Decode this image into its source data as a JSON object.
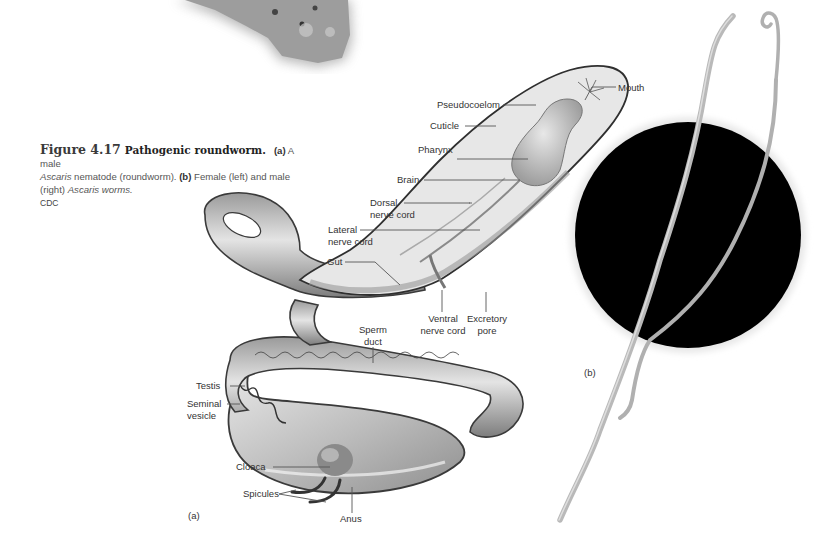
{
  "figure": {
    "number": "Figure 4.17",
    "title": "Pathogenic roundworm.",
    "caption": {
      "part_a_marker": "(a)",
      "part_a_text_1": " A male ",
      "part_a_italic": "Ascaris",
      "part_a_text_2": " nematode (roundworm). ",
      "part_b_marker": "(b)",
      "part_b_text_1": " Female (left) and male (right) ",
      "part_b_italic": "Ascaris worms.",
      "credit": "CDC"
    }
  },
  "panel_a": {
    "marker": "(a)",
    "labels": {
      "mouth": "Mouth",
      "pseudocoelom": "Pseudocoelom",
      "cuticle": "Cuticle",
      "pharynx": "Pharynx",
      "brain": "Brain",
      "dorsal_nerve_cord_1": "Dorsal",
      "dorsal_nerve_cord_2": "nerve cord",
      "lateral_nerve_cord_1": "Lateral",
      "lateral_nerve_cord_2": "nerve cord",
      "gut": "Gut",
      "ventral_nerve_cord_1": "Ventral",
      "ventral_nerve_cord_2": "nerve cord",
      "excretory_pore_1": "Excretory",
      "excretory_pore_2": "pore",
      "sperm_duct_1": "Sperm",
      "sperm_duct_2": "duct",
      "testis": "Testis",
      "seminal_vesicle_1": "Seminal",
      "seminal_vesicle_2": "vesicle",
      "cloaca": "Cloaca",
      "spicules": "Spicules",
      "anus": "Anus"
    }
  },
  "panel_b": {
    "marker": "(b)"
  },
  "colors": {
    "background": "#ffffff",
    "leader_line": "#555555",
    "worm_body": "#c9c9c9",
    "worm_outline": "#3a3a3a",
    "photo_background": "#000000",
    "photo_worm": "#bdbdbd"
  }
}
